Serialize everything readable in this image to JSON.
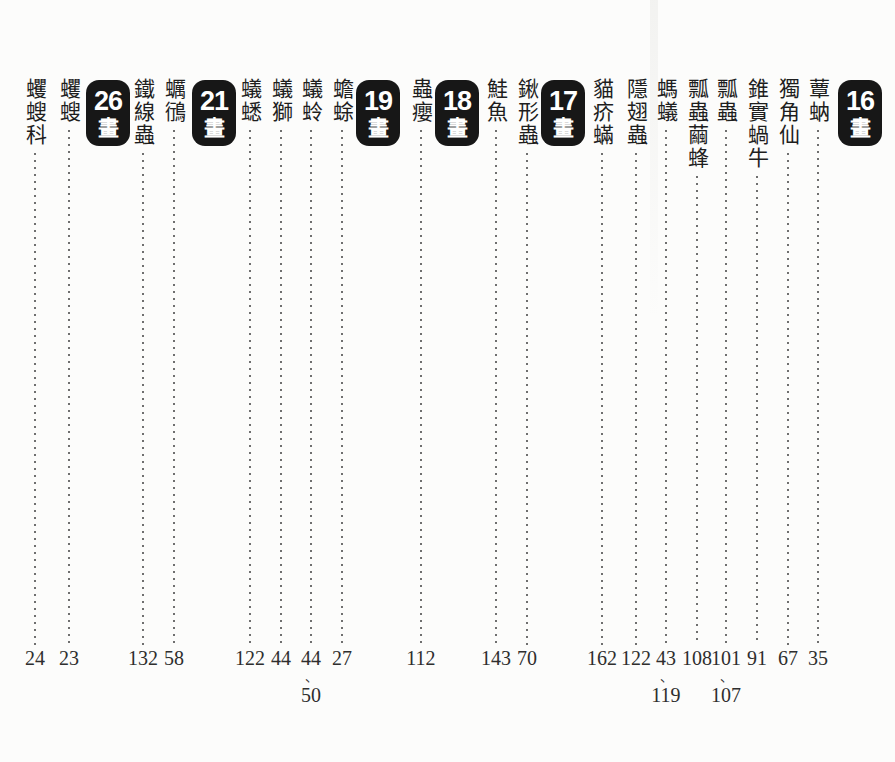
{
  "page": {
    "background": "#fcfcfb",
    "ink_color": "#1e1e1e",
    "number_color": "#2e2e2e",
    "badge_bg": "#171717",
    "badge_text_color": "#ffffff",
    "leader_dot_color": "#6f6f6f",
    "page_separator": "、",
    "stroke_suffix": "畫"
  },
  "columns": [
    {
      "kind": "badge",
      "strokes": "16",
      "x": 860
    },
    {
      "kind": "entry",
      "term": "蕈蚋",
      "pages": [
        "35"
      ],
      "x": 818
    },
    {
      "kind": "entry",
      "term": "獨角仙",
      "pages": [
        "67"
      ],
      "x": 788
    },
    {
      "kind": "entry",
      "term": "錐實蝸牛",
      "pages": [
        "91"
      ],
      "x": 757
    },
    {
      "kind": "entry",
      "term": "瓢蟲",
      "pages": [
        "101",
        "107"
      ],
      "x": 726
    },
    {
      "kind": "entry",
      "term": "瓢蟲繭蜂",
      "pages": [
        "108"
      ],
      "x": 697
    },
    {
      "kind": "entry",
      "term": "螞蟻",
      "pages": [
        "43",
        "119"
      ],
      "x": 666
    },
    {
      "kind": "entry",
      "term": "隱翅蟲",
      "pages": [
        "122"
      ],
      "x": 636
    },
    {
      "kind": "entry",
      "term": "貓疥蟎",
      "pages": [
        "162"
      ],
      "x": 602
    },
    {
      "kind": "badge",
      "strokes": "17",
      "x": 563
    },
    {
      "kind": "entry",
      "term": "鍬形蟲",
      "pages": [
        "70"
      ],
      "x": 527
    },
    {
      "kind": "entry",
      "term": "鮭魚",
      "pages": [
        "143"
      ],
      "x": 496
    },
    {
      "kind": "badge",
      "strokes": "18",
      "x": 457
    },
    {
      "kind": "entry",
      "term": "蟲癭",
      "pages": [
        "112"
      ],
      "x": 421
    },
    {
      "kind": "badge",
      "strokes": "19",
      "x": 378
    },
    {
      "kind": "entry",
      "term": "蟾蜍",
      "pages": [
        "27"
      ],
      "x": 342
    },
    {
      "kind": "entry",
      "term": "蟻蛉",
      "pages": [
        "44",
        "50"
      ],
      "x": 311
    },
    {
      "kind": "entry",
      "term": "蟻獅",
      "pages": [
        "44"
      ],
      "x": 281
    },
    {
      "kind": "entry",
      "term": "蟻蟋",
      "pages": [
        "122"
      ],
      "x": 250
    },
    {
      "kind": "badge",
      "strokes": "21",
      "x": 214
    },
    {
      "kind": "entry",
      "term": "蠣鴴",
      "pages": [
        "58"
      ],
      "x": 174
    },
    {
      "kind": "entry",
      "term": "鐵線蟲",
      "pages": [
        "132"
      ],
      "x": 143
    },
    {
      "kind": "badge",
      "strokes": "26",
      "x": 108
    },
    {
      "kind": "entry",
      "term": "蠼螋",
      "pages": [
        "23"
      ],
      "x": 69
    },
    {
      "kind": "entry",
      "term": "蠼螋科",
      "pages": [
        "24"
      ],
      "x": 35
    }
  ]
}
